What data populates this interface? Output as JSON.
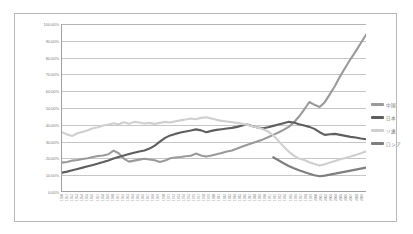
{
  "chart_data": {
    "type": "line",
    "title": "",
    "xlabel": "",
    "ylabel": "",
    "ylim": [
      0,
      100
    ],
    "ytick_labels": [
      "100.00%",
      "90.00%",
      "80.00%",
      "70.00%",
      "60.00%",
      "50.00%",
      "40.00%",
      "30.00%",
      "20.00%",
      "10.00%",
      "0.00%"
    ],
    "ytick_values": [
      100,
      90,
      80,
      70,
      60,
      50,
      40,
      30,
      20,
      10,
      0
    ],
    "grid": true,
    "legend_position": "right",
    "x": [
      "1950",
      "1951",
      "1952",
      "1953",
      "1954",
      "1955",
      "1956",
      "1957",
      "1958",
      "1959",
      "1960",
      "1961",
      "1962",
      "1963",
      "1964",
      "1965",
      "1966",
      "1967",
      "1968",
      "1969",
      "1970",
      "1971",
      "1972",
      "1973",
      "1974",
      "1975",
      "1976",
      "1977",
      "1978",
      "1979",
      "1980",
      "1981",
      "1982",
      "1983",
      "1984",
      "1985",
      "1986",
      "1987",
      "1988",
      "1989",
      "1990",
      "1991",
      "1992",
      "1993",
      "1994",
      "1995",
      "1996",
      "1997",
      "1998",
      "1999",
      "2000",
      "2001",
      "2002",
      "2003",
      "2004",
      "2005",
      "2006",
      "2007",
      "2008",
      "2009"
    ],
    "series": [
      {
        "name": "中国",
        "color": "#9a9a9a",
        "values": [
          17.0,
          17.4,
          18.2,
          18.6,
          19.2,
          19.6,
          20.4,
          21.0,
          21.3,
          22.0,
          24.2,
          22.6,
          19.4,
          17.6,
          18.2,
          18.8,
          19.3,
          18.9,
          18.4,
          17.4,
          18.2,
          19.6,
          20.1,
          20.4,
          20.8,
          21.1,
          22.4,
          21.3,
          20.6,
          21.2,
          22.0,
          22.8,
          23.6,
          24.3,
          25.4,
          26.6,
          27.7,
          28.7,
          29.8,
          30.9,
          32.2,
          33.6,
          35.0,
          36.6,
          38.4,
          41.0,
          44.6,
          48.8,
          53.3,
          51.6,
          50.3,
          53.2,
          58.0,
          63.0,
          68.8,
          74.0,
          79.0,
          83.6,
          88.6,
          93.6
        ]
      },
      {
        "name": "日本",
        "color": "#5e5e5e",
        "values": [
          11.0,
          11.6,
          12.4,
          13.2,
          14.0,
          14.8,
          15.6,
          16.4,
          17.3,
          18.3,
          19.4,
          20.4,
          21.3,
          22.1,
          22.9,
          23.6,
          24.3,
          25.4,
          27.2,
          29.6,
          31.8,
          33.3,
          34.2,
          35.0,
          35.6,
          36.2,
          36.9,
          36.3,
          35.2,
          36.0,
          36.6,
          37.0,
          37.4,
          37.8,
          38.4,
          39.2,
          39.8,
          38.8,
          38.0,
          37.6,
          38.2,
          39.0,
          39.8,
          40.6,
          41.4,
          41.0,
          40.0,
          39.2,
          38.4,
          37.2,
          35.2,
          33.6,
          34.0,
          34.2,
          33.6,
          33.0,
          32.4,
          32.0,
          31.4,
          31.0
        ]
      },
      {
        "name": "ソ連",
        "color": "#cfcfcf",
        "values": [
          35.2,
          33.8,
          33.0,
          34.6,
          35.4,
          36.4,
          37.6,
          38.2,
          39.2,
          39.8,
          40.6,
          40.0,
          41.2,
          40.2,
          41.4,
          41.0,
          40.4,
          40.8,
          40.2,
          40.8,
          41.4,
          41.0,
          41.8,
          42.3,
          42.8,
          43.4,
          43.0,
          43.8,
          44.2,
          43.4,
          42.6,
          42.0,
          41.6,
          41.2,
          40.8,
          40.2,
          39.6,
          38.8,
          38.0,
          37.0,
          35.6,
          33.4,
          30.0,
          26.6,
          23.6,
          21.2,
          19.4,
          18.6,
          17.2,
          16.2,
          15.2,
          16.0,
          17.0,
          18.0,
          19.0,
          19.8,
          20.6,
          21.6,
          22.6,
          23.8
        ]
      },
      {
        "name": "ロシア",
        "color": "#7e7e7e",
        "values": [
          null,
          null,
          null,
          null,
          null,
          null,
          null,
          null,
          null,
          null,
          null,
          null,
          null,
          null,
          null,
          null,
          null,
          null,
          null,
          null,
          null,
          null,
          null,
          null,
          null,
          null,
          null,
          null,
          null,
          null,
          null,
          null,
          null,
          null,
          null,
          null,
          null,
          null,
          null,
          null,
          null,
          20.2,
          18.4,
          16.6,
          15.0,
          13.6,
          12.4,
          11.4,
          10.4,
          9.4,
          8.8,
          9.2,
          9.8,
          10.4,
          11.0,
          11.6,
          12.2,
          12.8,
          13.4,
          14.0
        ]
      }
    ]
  },
  "legend": {
    "items": [
      {
        "label": "中国",
        "color": "#9a9a9a"
      },
      {
        "label": "日本",
        "color": "#5e5e5e"
      },
      {
        "label": "ソ連",
        "color": "#cfcfcf"
      },
      {
        "label": "ロシア",
        "color": "#7e7e7e"
      }
    ]
  }
}
